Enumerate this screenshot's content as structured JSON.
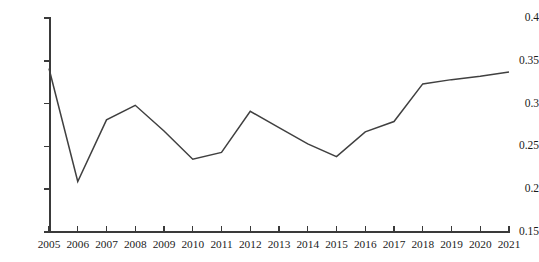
{
  "chart_data": {
    "type": "line",
    "title": "",
    "subtitle": "",
    "xlabel": "",
    "ylabel": "",
    "categories": [
      "2005",
      "2006",
      "2007",
      "2008",
      "2009",
      "2010",
      "2011",
      "2012",
      "2013",
      "2014",
      "2015",
      "2016",
      "2017",
      "2018",
      "2019",
      "2020",
      "2021"
    ],
    "x": [
      2005,
      2006,
      2007,
      2008,
      2009,
      2010,
      2011,
      2012,
      2013,
      2014,
      2015,
      2016,
      2017,
      2018,
      2019,
      2020,
      2021
    ],
    "values": [
      0.341,
      0.209,
      0.281,
      0.298,
      0.268,
      0.235,
      0.243,
      0.291,
      0.272,
      0.253,
      0.238,
      0.267,
      0.279,
      0.323,
      0.328,
      0.332,
      0.337
    ],
    "series": [
      {
        "name": "",
        "color": "#404040",
        "values": [
          0.341,
          0.209,
          0.281,
          0.298,
          0.268,
          0.235,
          0.243,
          0.291,
          0.272,
          0.253,
          0.238,
          0.267,
          0.279,
          0.323,
          0.328,
          0.332,
          0.337
        ]
      }
    ],
    "ylim": [
      0.15,
      0.4
    ],
    "yticks": [
      0.15,
      0.2,
      0.25,
      0.3,
      0.35,
      0.4
    ],
    "ytick_labels": [
      "0.15",
      "0.2",
      "0.25",
      "0.3",
      "0.35",
      "0.4"
    ],
    "xlim": [
      2005,
      2021
    ],
    "grid": false,
    "legend": false,
    "legend_position": "none",
    "markers": false,
    "annotations": []
  },
  "style": {
    "line_color": "#404040",
    "axis_color": "#3a3a3a",
    "text_color": "#1a1a1a",
    "background": "#ffffff",
    "line_width": "1.5"
  }
}
